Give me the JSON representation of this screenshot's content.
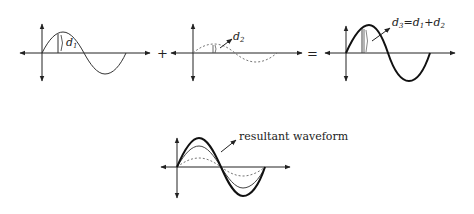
{
  "diagram": {
    "panels": [
      {
        "id": "wave1",
        "label_main": "d",
        "label_sub": "1",
        "style": "solid-thin",
        "amplitude": 21
      },
      {
        "id": "wave2",
        "label_main": "d",
        "label_sub": "2",
        "style": "dashed",
        "amplitude": 9
      },
      {
        "id": "wave3",
        "label_main": "d",
        "label_sub": "3",
        "equation_eq": "=",
        "equation_d1_main": "d",
        "equation_d1_sub": "1",
        "equation_plus": "+",
        "equation_d2_main": "d",
        "equation_d2_sub": "2",
        "style": "solid-thick",
        "amplitude": 28
      }
    ],
    "operators": {
      "plus": "+",
      "equals": "="
    },
    "resultant": {
      "label": "resultant waveform",
      "curves": [
        "thick (d3)",
        "thin (d1)",
        "dashed (d2)"
      ]
    },
    "colors": {
      "ink": "#222222",
      "dashed": "#666666",
      "background": "#ffffff"
    }
  }
}
